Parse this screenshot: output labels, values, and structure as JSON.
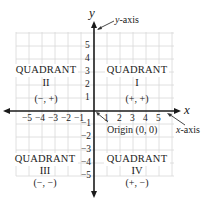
{
  "diagram": {
    "axes": {
      "x_label": "x",
      "y_label": "y",
      "x_callout": {
        "var": "x",
        "text": "-axis"
      },
      "y_callout": {
        "var": "y",
        "text": "-axis"
      },
      "origin_callout": "Origin (0, 0)"
    },
    "x_ticks": [
      "−5",
      "−4",
      "−3",
      "−2",
      "−1",
      "1",
      "2",
      "3",
      "4",
      "5"
    ],
    "y_ticks": [
      "5",
      "4",
      "3",
      "2",
      "1",
      "−1",
      "−2",
      "−3",
      "−4",
      "−5"
    ],
    "quadrants": [
      {
        "title": "QUADRANT",
        "numeral": "II",
        "signs": "(−, +)"
      },
      {
        "title": "QUADRANT",
        "numeral": "I",
        "signs": "(+, +)"
      },
      {
        "title": "QUADRANT",
        "numeral": "III",
        "signs": "(−, −)"
      },
      {
        "title": "QUADRANT",
        "numeral": "IV",
        "signs": "(+, −)"
      }
    ],
    "colors": {
      "axis": "#1a1a1a",
      "grid": "#d6d6d6",
      "text": "#222222"
    }
  }
}
